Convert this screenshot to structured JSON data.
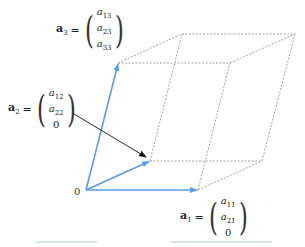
{
  "diagram": {
    "origin_label": "0",
    "vectors": [
      {
        "name": "a",
        "sub": "1",
        "eq": "=",
        "entries": [
          "a11",
          "a21",
          "0"
        ],
        "entries_display": [
          {
            "v": "a",
            "s": "11"
          },
          {
            "v": "a",
            "s": "21"
          },
          {
            "v": "0",
            "s": ""
          }
        ]
      },
      {
        "name": "a",
        "sub": "2",
        "eq": "=",
        "entries": [
          "a12",
          "a22",
          "0"
        ],
        "entries_display": [
          {
            "v": "a",
            "s": "12"
          },
          {
            "v": "a",
            "s": "22"
          },
          {
            "v": "0",
            "s": ""
          }
        ]
      },
      {
        "name": "a",
        "sub": "3",
        "eq": "=",
        "entries": [
          "a13",
          "a23",
          "a33"
        ],
        "entries_display": [
          {
            "v": "a",
            "s": "13"
          },
          {
            "v": "a",
            "s": "23"
          },
          {
            "v": "a",
            "s": "33"
          }
        ]
      }
    ],
    "colors": {
      "vector": "#5b9be8",
      "edges": "#888888",
      "pointer_arrow": "#111111",
      "text": "#222222"
    }
  }
}
